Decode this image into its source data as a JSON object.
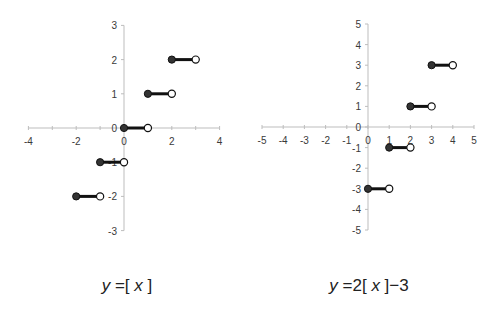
{
  "chart_data": [
    {
      "type": "line",
      "title": "y = [x]",
      "formula": {
        "y": "y",
        "eq": "=",
        "lb": "[",
        "x": "x",
        "rb": "]",
        "suffix": ""
      },
      "xlabel": "",
      "ylabel": "",
      "xlim": [
        -4,
        4
      ],
      "ylim": [
        -3,
        3
      ],
      "x_ticks": [
        -4,
        -2,
        0,
        2,
        4
      ],
      "y_ticks": [
        -3,
        -2,
        -1,
        0,
        1,
        2,
        3
      ],
      "grid": false,
      "legend": null,
      "segments": [
        {
          "x_start": -2,
          "x_end": -1,
          "y": -2,
          "start_closed": true,
          "end_open": true
        },
        {
          "x_start": -1,
          "x_end": 0,
          "y": -1,
          "start_closed": true,
          "end_open": true
        },
        {
          "x_start": 0,
          "x_end": 1,
          "y": 0,
          "start_closed": true,
          "end_open": true
        },
        {
          "x_start": 1,
          "x_end": 2,
          "y": 1,
          "start_closed": true,
          "end_open": true
        },
        {
          "x_start": 2,
          "x_end": 3,
          "y": 2,
          "start_closed": true,
          "end_open": true
        }
      ]
    },
    {
      "type": "line",
      "title": "y = 2[x] - 3",
      "formula": {
        "y": "y",
        "eq": "=",
        "coef": "2",
        "lb": "[",
        "x": "x",
        "rb": "]",
        "suffix": "−3"
      },
      "xlabel": "",
      "ylabel": "",
      "xlim": [
        -5,
        5
      ],
      "ylim": [
        -5,
        5
      ],
      "x_ticks": [
        -5,
        -4,
        -3,
        -2,
        -1,
        0,
        1,
        2,
        3,
        4,
        5
      ],
      "y_ticks": [
        -5,
        -4,
        -3,
        -2,
        -1,
        0,
        1,
        2,
        3,
        4,
        5
      ],
      "grid": false,
      "legend": null,
      "segments": [
        {
          "x_start": 0,
          "x_end": 1,
          "y": -3,
          "start_closed": true,
          "end_open": true
        },
        {
          "x_start": 1,
          "x_end": 2,
          "y": -1,
          "start_closed": true,
          "end_open": true
        },
        {
          "x_start": 2,
          "x_end": 3,
          "y": 1,
          "start_closed": true,
          "end_open": true
        },
        {
          "x_start": 3,
          "x_end": 4,
          "y": 3,
          "start_closed": true,
          "end_open": true
        }
      ]
    }
  ],
  "colors": {
    "axis": "#bdbdbd",
    "segment": "#111111",
    "closed_dot": "#333333",
    "open_dot": "#ffffff",
    "label": "#3a3a3a"
  }
}
